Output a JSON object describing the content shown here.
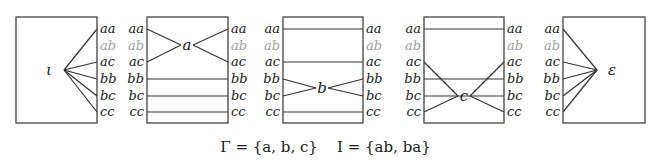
{
  "rows": [
    "aa",
    "ab",
    "ac",
    "bb",
    "bc",
    "cc"
  ],
  "faded_rows": [
    "ab"
  ],
  "row_y": [
    29,
    46,
    62,
    79,
    96,
    112
  ],
  "colors": {
    "stroke": "#333333",
    "text": "#1a1a1a",
    "faded_text": "#a0a0a0"
  },
  "boxes": [
    {
      "id": "iota",
      "node_label": "ι",
      "box": {
        "x": 16,
        "y": 17,
        "w": 81,
        "h": 106
      },
      "left_labels": false,
      "right_labels": true,
      "node": {
        "x": 58,
        "y": 70
      },
      "right_edges_to_node": [
        "aa",
        "ac",
        "bb",
        "bc",
        "cc"
      ],
      "left_edges_to_node": [],
      "straight_through": []
    },
    {
      "id": "a",
      "node_label": "a",
      "box": {
        "x": 147,
        "y": 17,
        "w": 81,
        "h": 106
      },
      "left_labels": true,
      "right_labels": true,
      "node": {
        "x": 187,
        "y": 45
      },
      "left_edges_to_node": [
        "aa",
        "ac"
      ],
      "right_edges_to_node": [
        "aa",
        "ac"
      ],
      "straight_through": [
        "bb",
        "bc",
        "cc"
      ]
    },
    {
      "id": "b",
      "node_label": "b",
      "box": {
        "x": 283,
        "y": 17,
        "w": 80,
        "h": 106
      },
      "left_labels": true,
      "right_labels": true,
      "node": {
        "x": 322,
        "y": 88
      },
      "left_edges_to_node": [
        "bb",
        "bc"
      ],
      "right_edges_to_node": [
        "bb",
        "bc"
      ],
      "straight_through": [
        "aa",
        "ac",
        "cc"
      ]
    },
    {
      "id": "c",
      "node_label": "c",
      "box": {
        "x": 424,
        "y": 17,
        "w": 80,
        "h": 106
      },
      "left_labels": true,
      "right_labels": true,
      "node": {
        "x": 464,
        "y": 96
      },
      "left_edges_to_node": [
        "ac",
        "cc"
      ],
      "right_edges_to_node": [
        "ac",
        "cc"
      ],
      "straight_through": [
        "aa",
        "bb",
        "bc"
      ]
    },
    {
      "id": "epsilon",
      "node_label": "ε",
      "box": {
        "x": 563,
        "y": 17,
        "w": 82,
        "h": 106
      },
      "left_labels": true,
      "right_labels": false,
      "node": {
        "x": 603,
        "y": 70
      },
      "left_edges_to_node": [
        "aa",
        "ac",
        "bb",
        "bc",
        "cc"
      ],
      "right_edges_to_node": [],
      "straight_through": []
    }
  ],
  "caption": {
    "gamma": "Γ = {a, b, c}",
    "independence": "I = {ab, ba}"
  }
}
